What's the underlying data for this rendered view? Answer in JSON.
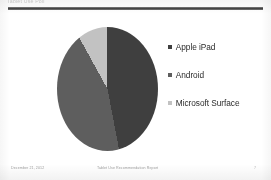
{
  "slide": {
    "title": "Tablet Use Poll",
    "rule_color": "#3d3d3d",
    "background": "#ffffff"
  },
  "legend": {
    "items": [
      {
        "label": "Apple iPad",
        "color": "#3f3f3f",
        "swatch_icon": "square-swatch-icon"
      },
      {
        "label": "Android",
        "color": "#5e5e5e",
        "swatch_icon": "square-swatch-icon"
      },
      {
        "label": "Microsoft Surface",
        "color": "#c2c2c2",
        "swatch_icon": "square-swatch-icon"
      }
    ]
  },
  "footer": {
    "date": "December 21, 2012",
    "title": "Tablet Use Recommendation Report",
    "page": "7"
  },
  "chart_data": {
    "type": "pie",
    "title": "Tablet Use Poll",
    "categories": [
      "Apple iPad",
      "Android",
      "Microsoft Surface"
    ],
    "values": [
      47,
      45,
      8
    ],
    "unit": "%",
    "colors": [
      "#3f3f3f",
      "#5e5e5e",
      "#c2c2c2"
    ],
    "legend_position": "right",
    "start_angle_deg": 0,
    "direction": "clockwise",
    "labels_shown": false,
    "grid": false
  }
}
